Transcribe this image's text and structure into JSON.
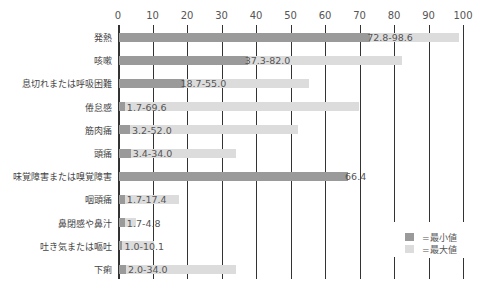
{
  "chart_data": {
    "type": "bar",
    "orientation": "horizontal",
    "title": "",
    "xlabel": "",
    "ylabel": "",
    "xlim": [
      0,
      100
    ],
    "x_ticks": [
      0,
      10,
      20,
      30,
      40,
      50,
      60,
      70,
      80,
      90,
      100
    ],
    "grid": true,
    "legend_position": "lower right",
    "categories": [
      "発熱",
      "咳嗽",
      "息切れまたは呼吸困難",
      "倦怠感",
      "筋肉痛",
      "頭痛",
      "味覚障害または嗅覚障害",
      "咽頭痛",
      "鼻閉感や鼻汁",
      "吐き気または嘔吐",
      "下痢"
    ],
    "series": [
      {
        "name": "=最小値",
        "color": "#9a9a9a",
        "values": [
          72.8,
          37.3,
          18.7,
          1.7,
          3.2,
          3.4,
          66.4,
          1.7,
          1.7,
          1.0,
          2.0
        ]
      },
      {
        "name": "=最大値",
        "color": "#dcdcdc",
        "values": [
          98.6,
          82.0,
          55.0,
          69.6,
          52.0,
          34.0,
          66.4,
          17.4,
          4.8,
          10.1,
          34.0
        ]
      }
    ],
    "data_labels": [
      "72.8-98.6",
      "37.3-82.0",
      "18.7-55.0",
      "1.7-69.6",
      "3.2-52.0",
      "3.4-34.0",
      "66.4",
      "1.7-17.4",
      "1.7-4.8",
      "1.0-10.1",
      "2.0-34.0"
    ]
  },
  "legend": {
    "min_label": "=最小値",
    "max_label": "=最大値"
  }
}
